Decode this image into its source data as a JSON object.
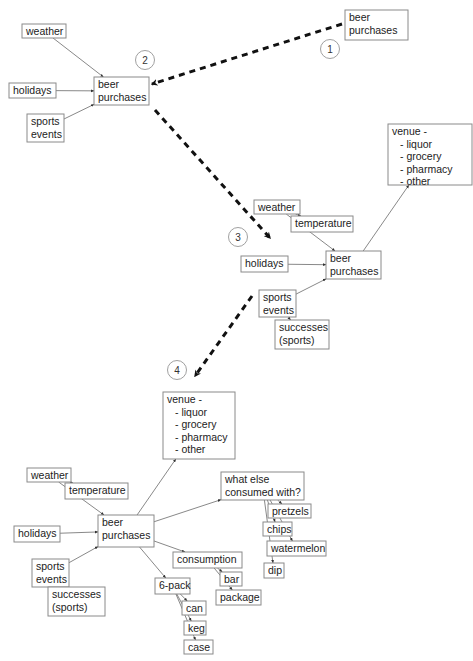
{
  "steps": [
    {
      "number": "1",
      "nodes": [
        {
          "id": "s1-beer",
          "lines": [
            "beer",
            "purchases"
          ]
        }
      ]
    },
    {
      "number": "2",
      "nodes": [
        {
          "id": "s2-weather",
          "lines": [
            "weather"
          ]
        },
        {
          "id": "s2-holidays",
          "lines": [
            "holidays"
          ]
        },
        {
          "id": "s2-sports",
          "lines": [
            "sports",
            "events"
          ]
        },
        {
          "id": "s2-beer",
          "lines": [
            "beer",
            "purchases"
          ]
        }
      ]
    },
    {
      "number": "3",
      "nodes": [
        {
          "id": "s3-venue",
          "lines": [
            "venue -",
            "  - liquor",
            "  - grocery",
            "  - pharmacy",
            "  - other"
          ]
        },
        {
          "id": "s3-weather",
          "lines": [
            "weather"
          ]
        },
        {
          "id": "s3-temperature",
          "lines": [
            "temperature"
          ]
        },
        {
          "id": "s3-holidays",
          "lines": [
            "holidays"
          ]
        },
        {
          "id": "s3-beer",
          "lines": [
            "beer",
            "purchases"
          ]
        },
        {
          "id": "s3-sports",
          "lines": [
            "sports",
            "events"
          ]
        },
        {
          "id": "s3-successes",
          "lines": [
            "successes",
            "(sports)"
          ]
        }
      ]
    },
    {
      "number": "4",
      "nodes": [
        {
          "id": "s4-venue",
          "lines": [
            "venue -",
            "  - liquor",
            "  - grocery",
            "  - pharmacy",
            "  - other"
          ]
        },
        {
          "id": "s4-weather",
          "lines": [
            "weather"
          ]
        },
        {
          "id": "s4-temperature",
          "lines": [
            "temperature"
          ]
        },
        {
          "id": "s4-holidays",
          "lines": [
            "holidays"
          ]
        },
        {
          "id": "s4-beer",
          "lines": [
            "beer",
            "purchases"
          ]
        },
        {
          "id": "s4-sports",
          "lines": [
            "sports",
            "events"
          ]
        },
        {
          "id": "s4-successes",
          "lines": [
            "successes",
            "(sports)"
          ]
        },
        {
          "id": "s4-whatelse",
          "lines": [
            "what else",
            "consumed with?"
          ]
        },
        {
          "id": "s4-pretzels",
          "lines": [
            "pretzels"
          ]
        },
        {
          "id": "s4-chips",
          "lines": [
            "chips"
          ]
        },
        {
          "id": "s4-watermelon",
          "lines": [
            "watermelon"
          ]
        },
        {
          "id": "s4-dip",
          "lines": [
            "dip"
          ]
        },
        {
          "id": "s4-consumption",
          "lines": [
            "consumption"
          ]
        },
        {
          "id": "s4-bar",
          "lines": [
            "bar"
          ]
        },
        {
          "id": "s4-package",
          "lines": [
            "package"
          ]
        },
        {
          "id": "s4-6pack",
          "lines": [
            "6-pack"
          ]
        },
        {
          "id": "s4-can",
          "lines": [
            "can"
          ]
        },
        {
          "id": "s4-keg",
          "lines": [
            "keg"
          ]
        },
        {
          "id": "s4-case",
          "lines": [
            "case"
          ]
        }
      ]
    }
  ],
  "edges": [
    [
      "s2-weather",
      "s2-beer"
    ],
    [
      "s2-holidays",
      "s2-beer"
    ],
    [
      "s2-sports",
      "s2-beer"
    ],
    [
      "s3-weather",
      "s3-temperature"
    ],
    [
      "s3-weather",
      "s3-beer"
    ],
    [
      "s3-holidays",
      "s3-beer"
    ],
    [
      "s3-sports",
      "s3-beer"
    ],
    [
      "s3-sports",
      "s3-successes"
    ],
    [
      "s3-beer",
      "s3-venue"
    ],
    [
      "s4-weather",
      "s4-temperature"
    ],
    [
      "s4-weather",
      "s4-beer"
    ],
    [
      "s4-holidays",
      "s4-beer"
    ],
    [
      "s4-sports",
      "s4-beer"
    ],
    [
      "s4-sports",
      "s4-successes"
    ],
    [
      "s4-beer",
      "s4-venue"
    ],
    [
      "s4-beer",
      "s4-whatelse"
    ],
    [
      "s4-beer",
      "s4-consumption"
    ],
    [
      "s4-beer",
      "s4-6pack"
    ],
    [
      "s4-whatelse",
      "s4-pretzels"
    ],
    [
      "s4-whatelse",
      "s4-chips"
    ],
    [
      "s4-whatelse",
      "s4-watermelon"
    ],
    [
      "s4-whatelse",
      "s4-dip"
    ],
    [
      "s4-consumption",
      "s4-bar"
    ],
    [
      "s4-consumption",
      "s4-package"
    ],
    [
      "s4-6pack",
      "s4-can"
    ],
    [
      "s4-6pack",
      "s4-keg"
    ],
    [
      "s4-6pack",
      "s4-case"
    ]
  ],
  "transitions": [
    [
      "1",
      "2"
    ],
    [
      "2",
      "3"
    ],
    [
      "3",
      "4"
    ]
  ]
}
